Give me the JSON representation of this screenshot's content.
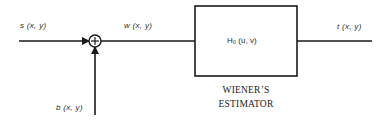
{
  "diagram": {
    "input_signal": "s (x, y)",
    "noise_signal": "b (x, y)",
    "summed_signal": "w (x, y)",
    "filter_label": "H₀ (u, v)",
    "filter_subscript": "0",
    "output_signal": "t (x, y)",
    "caption_line1": "WIENER’S",
    "caption_line2": "ESTIMATOR",
    "summing_symbol": "+",
    "colors": {
      "stroke": "#1a1a1a",
      "background": "#ffffff"
    }
  }
}
